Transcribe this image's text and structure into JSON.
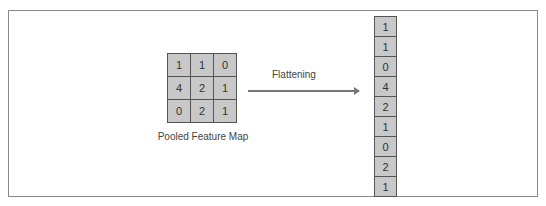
{
  "pooled_map": {
    "label": "Pooled Feature Map",
    "rows": [
      [
        "1",
        "1",
        "0"
      ],
      [
        "4",
        "2",
        "1"
      ],
      [
        "0",
        "2",
        "1"
      ]
    ]
  },
  "arrow": {
    "label": "Flattening"
  },
  "flattened": {
    "values": [
      "1",
      "1",
      "0",
      "4",
      "2",
      "1",
      "0",
      "2",
      "1"
    ]
  },
  "colors": {
    "cell_fill": "#c8c8c8",
    "border": "#555555",
    "frame": "#8a8a8a"
  }
}
